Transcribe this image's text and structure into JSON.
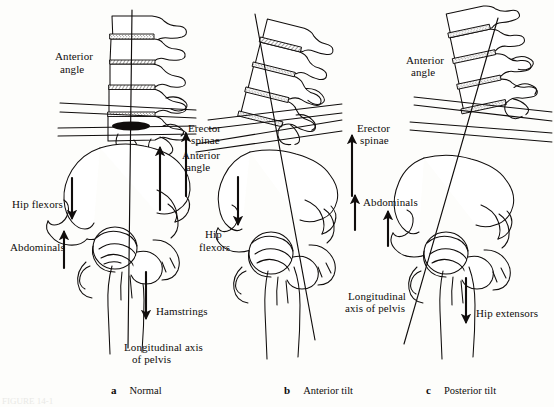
{
  "figure": {
    "background_color": "#fdfdfb",
    "ink_color": "#100d0c",
    "caption_cut_off": "FIGURE 14-1"
  },
  "panels": [
    {
      "letter": "a",
      "name": "Normal",
      "caption_x": 100,
      "caption_y": 377,
      "labels": [
        {
          "text": "Anterior",
          "x": 55,
          "y": 57,
          "align": "left"
        },
        {
          "text": "angle",
          "x": 60,
          "y": 69,
          "align": "left"
        },
        {
          "text": "Hip flexors",
          "x": 12,
          "y": 203,
          "align": "left"
        },
        {
          "text": "Abdominals",
          "x": 10,
          "y": 246,
          "align": "left"
        },
        {
          "text": "Hamstrings",
          "x": 155,
          "y": 310,
          "align": "left"
        },
        {
          "text": "Longitudinal axis",
          "x": 125,
          "y": 347,
          "align": "left"
        },
        {
          "text": "of pelvis",
          "x": 133,
          "y": 359,
          "align": "left"
        }
      ],
      "arrows": [
        {
          "name": "erector-spinae-arrow",
          "direction": "up"
        },
        {
          "name": "hip-flexors-arrow",
          "direction": "down"
        },
        {
          "name": "abdominals-arrow",
          "direction": "up"
        },
        {
          "name": "hamstrings-arrow",
          "direction": "down"
        }
      ]
    },
    {
      "letter": "b",
      "name": "Anterior tilt",
      "caption_x": 273,
      "caption_y": 377,
      "labels": [
        {
          "text": "Erector",
          "x": 188,
          "y": 128,
          "align": "left"
        },
        {
          "text": "spinae",
          "x": 191,
          "y": 140,
          "align": "left"
        },
        {
          "text": "Anterior",
          "x": 182,
          "y": 155,
          "align": "left"
        },
        {
          "text": "angle",
          "x": 186,
          "y": 167,
          "align": "left"
        },
        {
          "text": "Hip",
          "x": 229,
          "y": 205,
          "align": "left"
        },
        {
          "text": "flexors",
          "x": 224,
          "y": 223,
          "align": "left"
        },
        {
          "text": "Abdominals",
          "x": 362,
          "y": 200,
          "align": "left"
        },
        {
          "text": "Longitudinal",
          "x": 348,
          "y": 295,
          "align": "left"
        },
        {
          "text": "axis of pelvis",
          "x": 345,
          "y": 307,
          "align": "left"
        }
      ],
      "arrows": [
        {
          "name": "erector-spinae-arrow",
          "direction": "up"
        },
        {
          "name": "hip-flexors-arrow",
          "direction": "down"
        },
        {
          "name": "abdominals-arrow",
          "direction": "up"
        }
      ]
    },
    {
      "letter": "c",
      "name": "Posterior tilt",
      "caption_x": 415,
      "caption_y": 377,
      "labels": [
        {
          "text": "Anterior",
          "x": 406,
          "y": 60,
          "align": "left"
        },
        {
          "text": "angle",
          "x": 411,
          "y": 72,
          "align": "left"
        },
        {
          "text": "Erector",
          "x": 354,
          "y": 128,
          "align": "left"
        },
        {
          "text": "spinae",
          "x": 357,
          "y": 140,
          "align": "left"
        },
        {
          "text": "Hip extensors",
          "x": 474,
          "y": 312,
          "align": "left"
        }
      ],
      "arrows": [
        {
          "name": "erector-spinae-arrow",
          "direction": "up"
        },
        {
          "name": "abdominals-arrow",
          "direction": "up"
        },
        {
          "name": "hip-extensors-arrow",
          "direction": "down"
        }
      ]
    }
  ]
}
